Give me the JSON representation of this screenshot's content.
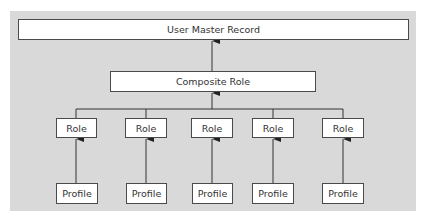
{
  "diagram": {
    "top": {
      "label": "User Master Record"
    },
    "middle": {
      "label": "Composite Role"
    },
    "roles": [
      {
        "label": "Role"
      },
      {
        "label": "Role"
      },
      {
        "label": "Role"
      },
      {
        "label": "Role"
      },
      {
        "label": "Role"
      }
    ],
    "profiles": [
      {
        "label": "Profile"
      },
      {
        "label": "Profile"
      },
      {
        "label": "Profile"
      },
      {
        "label": "Profile"
      },
      {
        "label": "Profile"
      }
    ],
    "colors": {
      "background": "#d9d9d9",
      "box": "#ffffff",
      "line": "#333333"
    }
  }
}
